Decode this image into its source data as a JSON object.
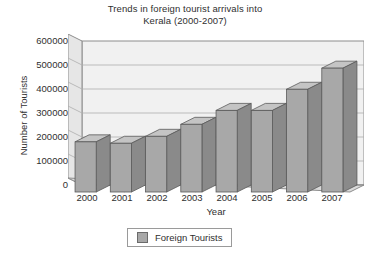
{
  "chart_data": {
    "type": "bar",
    "title": "Trends in foreign tourist arrivals into Kerala (2000-2007)",
    "title_lines": [
      "Trends in foreign tourist arrivals into",
      "Kerala (2000-2007)"
    ],
    "xlabel": "Year",
    "ylabel": "Number of Tourists",
    "categories": [
      "2000",
      "2001",
      "2002",
      "2003",
      "2004",
      "2005",
      "2006",
      "2007"
    ],
    "values": [
      209000,
      203000,
      232000,
      282000,
      340000,
      340000,
      428000,
      516000
    ],
    "series": [
      {
        "name": "Foreign Tourists",
        "values": [
          209000,
          203000,
          232000,
          282000,
          340000,
          340000,
          428000,
          516000
        ],
        "color": "#a8a8a8"
      }
    ],
    "ylim": [
      0,
      600000
    ],
    "ytick_values": [
      0,
      100000,
      200000,
      300000,
      400000,
      500000,
      600000
    ],
    "ytick_labels": [
      "0",
      "100000",
      "200000",
      "300000",
      "400000",
      "500000",
      "600000"
    ],
    "grid": true,
    "grid_axis": "y",
    "legend": {
      "position": "bottom",
      "entries": [
        {
          "label": "Foreign Tourists",
          "swatch_color": "#a8a8a8"
        }
      ]
    },
    "style": {
      "three_d": true,
      "bar_face_color": "#a8a8a8",
      "bar_top_color": "#c4c4c4",
      "bar_side_color": "#8a8a8a",
      "bar_edge_color": "#5a5a5a",
      "plot_back_color": "#f0f0f0",
      "plot_floor_color": "#d8d8d8",
      "plot_left_wall_color": "#e2e2e2",
      "gridline_color": "#a9a9a9",
      "text_color": "#2f2f2f"
    }
  }
}
